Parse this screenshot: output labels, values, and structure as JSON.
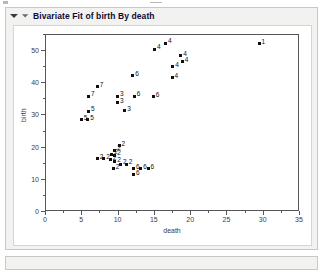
{
  "window": {
    "title": "Bivariate Fit of birth By death",
    "disclosure_icon": "triangle-down-icon",
    "secondary_disclosure_icon": "triangle-down-small-icon"
  },
  "chart_data": {
    "type": "scatter",
    "title": "Bivariate Fit of birth By death",
    "xlabel": "death",
    "ylabel": "birth",
    "xlim": [
      0,
      35
    ],
    "ylim": [
      0,
      55
    ],
    "xticks": [
      0,
      5,
      10,
      15,
      20,
      25,
      30,
      35
    ],
    "yticks": [
      0,
      10,
      20,
      30,
      40,
      50
    ],
    "xminor_ticks": [
      2.5,
      7.5,
      12.5,
      17.5,
      22.5,
      27.5,
      32.5
    ],
    "yminor_ticks": [
      5,
      15,
      25,
      35,
      45,
      55
    ],
    "grid": false,
    "legend": "none",
    "marker": "filled-square",
    "marker_color": "#101010",
    "point_labels_shown": true,
    "points": [
      {
        "x": 29.5,
        "y": 52.0,
        "label": "1"
      },
      {
        "x": 16.6,
        "y": 52.2,
        "label": "4"
      },
      {
        "x": 15.1,
        "y": 50.2,
        "label": "4"
      },
      {
        "x": 18.7,
        "y": 48.2,
        "label": "4"
      },
      {
        "x": 18.9,
        "y": 46.4,
        "label": "4"
      },
      {
        "x": 17.6,
        "y": 44.8,
        "label": "4"
      },
      {
        "x": 17.5,
        "y": 41.4,
        "label": "4"
      },
      {
        "x": 12.1,
        "y": 42.0,
        "label": "6"
      },
      {
        "x": 12.3,
        "y": 35.6,
        "label": "6"
      },
      {
        "x": 14.9,
        "y": 35.5,
        "label": "6"
      },
      {
        "x": 7.2,
        "y": 38.6,
        "label": "7"
      },
      {
        "x": 6.0,
        "y": 35.6,
        "label": "7"
      },
      {
        "x": 10.0,
        "y": 35.7,
        "label": "3"
      },
      {
        "x": 10.0,
        "y": 33.6,
        "label": "3"
      },
      {
        "x": 11.0,
        "y": 31.1,
        "label": "3"
      },
      {
        "x": 6.0,
        "y": 31.0,
        "label": "5"
      },
      {
        "x": 5.0,
        "y": 28.4,
        "label": "5"
      },
      {
        "x": 5.9,
        "y": 28.4,
        "label": "5"
      },
      {
        "x": 10.2,
        "y": 20.2,
        "label": "2"
      },
      {
        "x": 9.6,
        "y": 18.8,
        "label": "2"
      },
      {
        "x": 9.2,
        "y": 17.6,
        "label": "2"
      },
      {
        "x": 9.6,
        "y": 17.3,
        "label": "2"
      },
      {
        "x": 7.2,
        "y": 16.2,
        "label": "2"
      },
      {
        "x": 8.1,
        "y": 16.2,
        "label": "2"
      },
      {
        "x": 9.0,
        "y": 16.0,
        "label": "2"
      },
      {
        "x": 9.6,
        "y": 15.3,
        "label": "2"
      },
      {
        "x": 10.4,
        "y": 14.6,
        "label": "2"
      },
      {
        "x": 11.2,
        "y": 14.6,
        "label": "2"
      },
      {
        "x": 9.4,
        "y": 13.2,
        "label": "2"
      },
      {
        "x": 12.2,
        "y": 13.2,
        "label": "6"
      },
      {
        "x": 13.2,
        "y": 13.2,
        "label": "6"
      },
      {
        "x": 14.2,
        "y": 13.2,
        "label": "6"
      },
      {
        "x": 12.2,
        "y": 11.3,
        "label": "6"
      }
    ]
  }
}
